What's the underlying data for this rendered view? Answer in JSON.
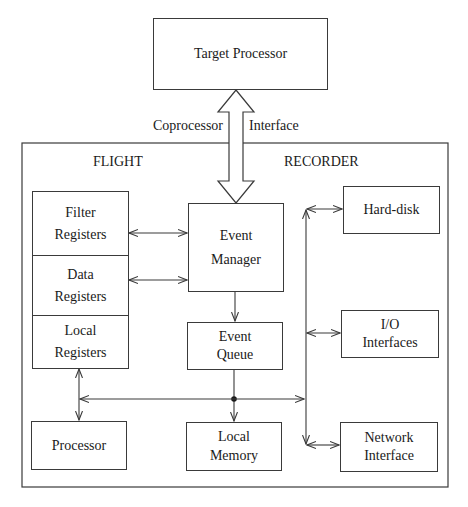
{
  "diagram": {
    "target_processor": {
      "label": "Target Processor"
    },
    "interface_label": {
      "left": "Coprocessor",
      "right": "Interface"
    },
    "recorder": {
      "title_left": "FLIGHT",
      "title_right": "RECORDER"
    },
    "registers": [
      {
        "line1": "Filter",
        "line2": "Registers"
      },
      {
        "line1": "Data",
        "line2": "Registers"
      },
      {
        "line1": "Local",
        "line2": "Registers"
      }
    ],
    "event_manager": {
      "line1": "Event",
      "line2": "Manager"
    },
    "event_queue": {
      "line1": "Event",
      "line2": "Queue"
    },
    "processor": {
      "label": "Processor"
    },
    "local_memory": {
      "line1": "Local",
      "line2": "Memory"
    },
    "hard_disk": {
      "label": "Hard-disk"
    },
    "io_interfaces": {
      "line1": "I/O",
      "line2": "Interfaces"
    },
    "network_interface": {
      "line1": "Network",
      "line2": "Interface"
    },
    "colors": {
      "line": "#3a3a3a",
      "text": "#1a1a1a",
      "background": "#ffffff"
    }
  }
}
